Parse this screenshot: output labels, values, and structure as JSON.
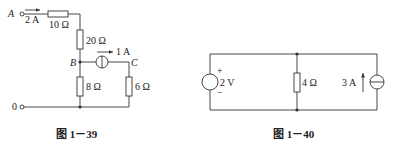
{
  "figures": [
    {
      "caption": "图 1－39",
      "labels": {
        "terminal_a": "A",
        "terminal_0": "0",
        "current_a": "2 A",
        "r1": "10 Ω",
        "r2": "20 Ω",
        "node_b": "B",
        "node_c": "C",
        "source_current": "1 A",
        "r3": "8 Ω",
        "r4": "6 Ω"
      }
    },
    {
      "caption": "图 1－40",
      "labels": {
        "voltage_source": "2 V",
        "plus": "+",
        "minus": "−",
        "resistor": "4 Ω",
        "current_source": "3 A"
      }
    }
  ],
  "colors": {
    "line": "#333333",
    "text": "#222222"
  }
}
